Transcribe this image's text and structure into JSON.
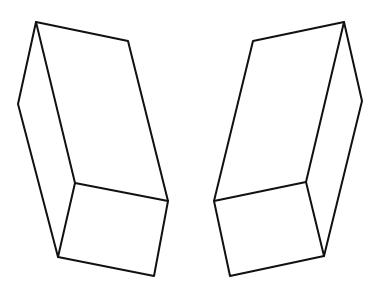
{
  "diagram": {
    "stroke_color": "#111111",
    "background": "#ffffff",
    "shapes": [
      {
        "name": "left-box",
        "outline": [
          [
            36,
            22
          ],
          [
            128,
            41
          ],
          [
            168,
            201
          ],
          [
            154,
            276
          ],
          [
            58,
            257
          ],
          [
            18,
            104
          ]
        ],
        "inner_corner": [
          75,
          183
        ],
        "inner_edges_to": [
          [
            36,
            22
          ],
          [
            168,
            201
          ],
          [
            58,
            257
          ]
        ]
      },
      {
        "name": "right-box",
        "outline": [
          [
            253,
            41
          ],
          [
            344,
            22
          ],
          [
            362,
            101
          ],
          [
            324,
            256
          ],
          [
            230,
            276
          ],
          [
            214,
            201
          ]
        ],
        "inner_corner": [
          306,
          182
        ],
        "inner_edges_to": [
          [
            344,
            22
          ],
          [
            214,
            201
          ],
          [
            324,
            256
          ]
        ]
      }
    ]
  }
}
